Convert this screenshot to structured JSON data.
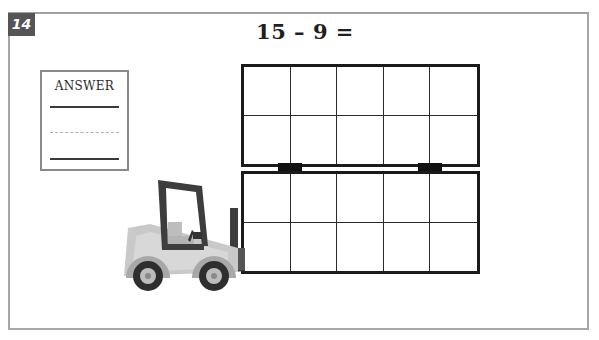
{
  "problem": {
    "number": "14",
    "equation": "15 – 9 =",
    "operand_a": 15,
    "operator": "–",
    "operand_b": 9
  },
  "answer_box": {
    "label": "ANSWER",
    "value": ""
  },
  "ten_frames": {
    "count": 2,
    "columns": 5,
    "rows": 2,
    "filled_cells": 0
  },
  "illustration": {
    "subject": "forklift",
    "description": "Gray forklift lifting two stacked empty ten-frames"
  },
  "colors": {
    "border": "#a6a6a6",
    "badge_bg": "#555555",
    "badge_text": "#ffffff",
    "frame_line": "#1a1a1a",
    "text": "#1f1f1f"
  }
}
